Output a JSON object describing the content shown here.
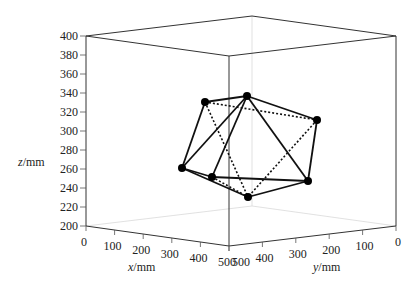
{
  "chart_data": {
    "type": "scatter3d",
    "title": "",
    "xlabel": "x/mm",
    "ylabel": "y/mm",
    "zlabel": "z/mm",
    "xlim": [
      0,
      500
    ],
    "ylim": [
      0,
      500
    ],
    "zlim": [
      200,
      400
    ],
    "x_ticks": [
      "0",
      "100",
      "200",
      "300",
      "400",
      "500"
    ],
    "y_ticks": [
      "500",
      "400",
      "300",
      "200",
      "100",
      "0"
    ],
    "z_ticks": [
      "400",
      "380",
      "360",
      "340",
      "320",
      "300",
      "280",
      "260",
      "240",
      "220",
      "200"
    ],
    "grid": false,
    "legend": null,
    "vertices_screen": [
      {
        "id": "A",
        "sx": 205,
        "sy": 102
      },
      {
        "id": "B",
        "sx": 247,
        "sy": 96
      },
      {
        "id": "C",
        "sx": 317,
        "sy": 120
      },
      {
        "id": "D",
        "sx": 182,
        "sy": 168
      },
      {
        "id": "E",
        "sx": 212,
        "sy": 177
      },
      {
        "id": "F",
        "sx": 308,
        "sy": 181
      },
      {
        "id": "G",
        "sx": 248,
        "sy": 197
      }
    ],
    "solid_edges": [
      [
        "A",
        "B"
      ],
      [
        "A",
        "D"
      ],
      [
        "B",
        "D"
      ],
      [
        "B",
        "E"
      ],
      [
        "B",
        "C"
      ],
      [
        "B",
        "F"
      ],
      [
        "C",
        "F"
      ],
      [
        "D",
        "E"
      ],
      [
        "D",
        "G"
      ],
      [
        "E",
        "F"
      ],
      [
        "G",
        "F"
      ]
    ],
    "dotted_edges": [
      [
        "A",
        "C"
      ],
      [
        "A",
        "G"
      ],
      [
        "C",
        "G"
      ],
      [
        "E",
        "G"
      ]
    ],
    "marker_color": "#000000",
    "line_color": "#111111"
  },
  "labels": {
    "x_axis": "x/mm",
    "y_axis": "y/mm",
    "z_axis": "z/mm"
  }
}
